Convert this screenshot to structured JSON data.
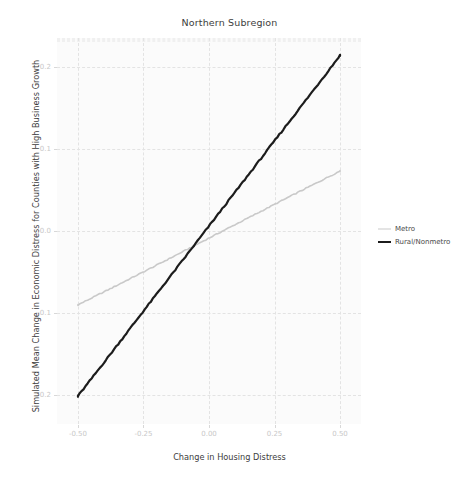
{
  "chart_data": {
    "type": "line",
    "title": "Northern Subregion",
    "xlabel": "Change in Housing Distress",
    "ylabel": "Simulated Mean Change in Economic Distress for Counties with High Business Growth",
    "xlim": [
      -0.58,
      0.58
    ],
    "ylim": [
      -0.235,
      0.235
    ],
    "xticks": [
      -0.5,
      -0.25,
      0.0,
      0.25,
      0.5
    ],
    "xticklabels": [
      "-0.50",
      "-0.25",
      "0.00",
      "0.25",
      "0.50"
    ],
    "yticks": [
      -0.2,
      -0.1,
      0.0,
      0.1,
      0.2
    ],
    "yticklabels": [
      "-0.2",
      "-0.1",
      "0.0",
      "0.1",
      "0.2"
    ],
    "grid": true,
    "legend_position": "right",
    "series": [
      {
        "name": "Metro",
        "color": "#c9c9c9",
        "width": 1.6,
        "x": [
          -0.5,
          -0.45,
          -0.4,
          -0.35,
          -0.3,
          -0.25,
          -0.2,
          -0.15,
          -0.1,
          -0.05,
          0.0,
          0.05,
          0.1,
          0.15,
          0.2,
          0.25,
          0.3,
          0.35,
          0.4,
          0.45,
          0.5
        ],
        "values": [
          -0.09,
          -0.082,
          -0.074,
          -0.066,
          -0.0578,
          -0.0498,
          -0.0416,
          -0.0334,
          -0.0252,
          -0.0168,
          -0.0086,
          -0.0004,
          0.0078,
          0.016,
          0.0242,
          0.0324,
          0.0406,
          0.0487,
          0.0568,
          0.065,
          0.073
        ]
      },
      {
        "name": "Rural/Nonmetro",
        "color": "#1c1c1c",
        "width": 2.2,
        "x": [
          -0.5,
          -0.45,
          -0.4,
          -0.35,
          -0.3,
          -0.25,
          -0.2,
          -0.15,
          -0.1,
          -0.05,
          0.0,
          0.05,
          0.1,
          0.15,
          0.2,
          0.25,
          0.3,
          0.35,
          0.4,
          0.45,
          0.5
        ],
        "values": [
          -0.201,
          -0.1805,
          -0.1598,
          -0.139,
          -0.1182,
          -0.0975,
          -0.0768,
          -0.0562,
          -0.0355,
          -0.0148,
          0.006,
          0.0268,
          0.0475,
          0.0682,
          0.089,
          0.1098,
          0.1305,
          0.1512,
          0.172,
          0.1928,
          0.214
        ]
      }
    ]
  },
  "legend": {
    "items": [
      {
        "label": "Metro",
        "key": "metro"
      },
      {
        "label": "Rural/Nonmetro",
        "key": "rural"
      }
    ]
  }
}
